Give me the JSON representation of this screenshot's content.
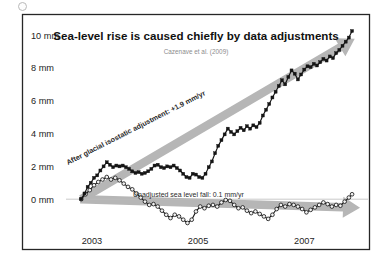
{
  "figure": {
    "speck_icon": "dot-artifact",
    "background": "#ffffff",
    "frame_color": "#262626"
  },
  "chart_data": {
    "type": "line",
    "title": "Sea-level rise is caused chiefly by data adjustments",
    "subtitle": "Cazenave et al. (2009)",
    "xlabel": "",
    "ylabel": "",
    "grid": false,
    "legend_position": "none",
    "ylim": [
      -2,
      10.8
    ],
    "xlim": [
      2002.55,
      2008.2
    ],
    "ytick_labels": [
      "10 mm",
      "8 mm",
      "6 mm",
      "4 mm",
      "2 mm",
      "0 mm"
    ],
    "ytick_values": [
      10,
      8,
      6,
      4,
      2,
      0
    ],
    "xtick_labels": [
      "2003",
      "2005",
      "2007"
    ],
    "xtick_values": [
      2003,
      2005,
      2007
    ],
    "annotations": [
      {
        "name": "adjusted-trend-label",
        "text": "After glacial isostatic adjustment: +1.9 mm/yr",
        "rate_mm_per_yr": 1.9,
        "rotation_deg": -27
      },
      {
        "name": "unadjusted-trend-label",
        "text": "Unadjusted sea level fall: 0.1 mm/yr",
        "rate_mm_per_yr": -0.1,
        "rotation_deg": 0
      }
    ],
    "trend_arrows": [
      {
        "name": "rising-trend-arrow",
        "color": "#b6b6b6",
        "direction": "up-right"
      },
      {
        "name": "flat-trend-arrow",
        "color": "#b6b6b6",
        "direction": "right-slightly-down"
      }
    ],
    "series": [
      {
        "name": "After glacial isostatic adjustment",
        "marker": "filled-square",
        "color": "#151515",
        "x": [
          2002.8,
          2002.86,
          2002.92,
          2002.98,
          2003.04,
          2003.1,
          2003.16,
          2003.22,
          2003.28,
          2003.34,
          2003.4,
          2003.46,
          2003.52,
          2003.58,
          2003.64,
          2003.7,
          2003.76,
          2003.82,
          2003.88,
          2003.94,
          2004.0,
          2004.06,
          2004.12,
          2004.18,
          2004.24,
          2004.3,
          2004.36,
          2004.42,
          2004.48,
          2004.54,
          2004.6,
          2004.66,
          2004.72,
          2004.78,
          2004.84,
          2004.9,
          2004.96,
          2005.02,
          2005.08,
          2005.14,
          2005.2,
          2005.26,
          2005.32,
          2005.38,
          2005.44,
          2005.5,
          2005.56,
          2005.62,
          2005.68,
          2005.74,
          2005.8,
          2005.86,
          2005.92,
          2005.98,
          2006.04,
          2006.1,
          2006.16,
          2006.22,
          2006.28,
          2006.34,
          2006.4,
          2006.46,
          2006.52,
          2006.58,
          2006.64,
          2006.7,
          2006.76,
          2006.82,
          2006.88,
          2006.94,
          2007.0,
          2007.06,
          2007.12,
          2007.18,
          2007.24,
          2007.3,
          2007.36,
          2007.42,
          2007.48,
          2007.54,
          2007.6,
          2007.66,
          2007.72,
          2007.78,
          2007.84,
          2007.9
        ],
        "y": [
          0.0,
          0.35,
          0.75,
          1.0,
          1.3,
          1.45,
          1.75,
          2.0,
          2.25,
          2.1,
          1.95,
          2.05,
          2.0,
          2.05,
          1.95,
          1.85,
          1.7,
          1.6,
          1.65,
          1.55,
          1.6,
          1.7,
          1.85,
          2.05,
          2.1,
          1.95,
          1.9,
          2.0,
          1.95,
          2.05,
          1.9,
          1.75,
          1.55,
          1.35,
          1.3,
          1.55,
          1.5,
          1.35,
          1.3,
          1.55,
          1.95,
          2.3,
          2.8,
          3.25,
          3.6,
          3.95,
          4.3,
          4.1,
          3.95,
          4.15,
          4.35,
          4.2,
          4.45,
          4.3,
          4.5,
          4.4,
          4.65,
          5.1,
          5.45,
          5.8,
          6.2,
          6.55,
          6.9,
          7.25,
          7.0,
          7.45,
          7.85,
          7.65,
          7.3,
          7.6,
          7.9,
          8.1,
          8.05,
          8.25,
          8.15,
          8.35,
          8.55,
          8.45,
          8.7,
          8.6,
          8.9,
          9.1,
          9.35,
          9.6,
          9.85,
          10.25
        ]
      },
      {
        "name": "Unadjusted sea level",
        "marker": "open-circle",
        "color": "#1a1a1a",
        "x": [
          2002.8,
          2002.88,
          2002.96,
          2003.04,
          2003.12,
          2003.2,
          2003.28,
          2003.36,
          2003.44,
          2003.52,
          2003.6,
          2003.68,
          2003.76,
          2003.84,
          2003.92,
          2004.0,
          2004.08,
          2004.16,
          2004.24,
          2004.32,
          2004.4,
          2004.48,
          2004.56,
          2004.64,
          2004.72,
          2004.8,
          2004.88,
          2004.96,
          2005.04,
          2005.12,
          2005.2,
          2005.28,
          2005.36,
          2005.44,
          2005.52,
          2005.6,
          2005.68,
          2005.76,
          2005.84,
          2005.92,
          2006.0,
          2006.08,
          2006.16,
          2006.24,
          2006.32,
          2006.4,
          2006.48,
          2006.56,
          2006.64,
          2006.72,
          2006.8,
          2006.88,
          2006.96,
          2007.04,
          2007.12,
          2007.2,
          2007.28,
          2007.36,
          2007.44,
          2007.52,
          2007.6,
          2007.68,
          2007.76,
          2007.84,
          2007.9
        ],
        "y": [
          0.0,
          0.3,
          0.55,
          0.85,
          1.05,
          1.2,
          1.35,
          1.2,
          1.3,
          1.15,
          0.95,
          0.75,
          0.6,
          0.35,
          0.1,
          -0.15,
          -0.35,
          -0.3,
          -0.45,
          -0.7,
          -0.95,
          -1.15,
          -0.95,
          -1.05,
          -1.25,
          -1.45,
          -1.25,
          -0.75,
          -0.45,
          -0.55,
          -0.4,
          -0.35,
          -0.45,
          -0.2,
          -0.05,
          -0.1,
          -0.35,
          -0.55,
          -0.5,
          -0.7,
          -0.85,
          -0.75,
          -0.9,
          -1.05,
          -1.2,
          -0.95,
          -0.6,
          -0.35,
          -0.45,
          -0.3,
          -0.35,
          -0.45,
          -0.6,
          -0.8,
          -0.65,
          -0.5,
          -0.35,
          -0.2,
          -0.3,
          -0.45,
          -0.35,
          -0.4,
          -0.15,
          0.1,
          0.3
        ]
      }
    ]
  }
}
